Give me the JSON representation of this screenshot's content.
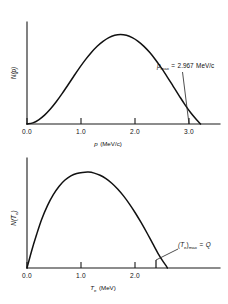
{
  "figure": {
    "background_color": "#ffffff",
    "line_color": "#111111",
    "panels": [
      "momentum-spectrum",
      "kinetic-energy-spectrum"
    ]
  },
  "panel_top": {
    "y_axis_label": "N(p)",
    "x_axis_title_symbol": "p",
    "x_axis_title_unit": "(MeV/c)",
    "x_tick_labels": [
      "0.0",
      "1.0",
      "2.0",
      "3.0"
    ],
    "annotation": {
      "symbol": "p",
      "subscript": "max",
      "equals": "=",
      "value": "2.967",
      "unit": "MeV/c",
      "full_text": "pmax = 2.967 MeV/c"
    }
  },
  "panel_bottom": {
    "y_axis_label": "N(Te)",
    "y_axis_label_symbol": "N(T",
    "y_axis_label_sub": "e",
    "y_axis_label_close": ")",
    "x_axis_title_symbol": "T",
    "x_axis_title_sub": "e",
    "x_axis_title_unit": "(MeV)",
    "x_tick_labels": [
      "0.0",
      "1.0",
      "2.0"
    ],
    "annotation": {
      "open": "(T",
      "subscript_e": "e",
      "close": ")",
      "subscript_max": "max",
      "equals": "=",
      "value": "Q",
      "full_text": "(Te)max = Q"
    }
  },
  "chart_data": [
    {
      "type": "line",
      "id": "momentum-spectrum",
      "title": "",
      "xlabel": "p (MeV/c)",
      "ylabel": "N(p)",
      "xlim": [
        0.0,
        3.3
      ],
      "ylim": [
        0,
        1.05
      ],
      "xticks": [
        0.0,
        1.0,
        2.0,
        3.0
      ],
      "grid": false,
      "legend": null,
      "annotations": [
        {
          "text": "pmax = 2.967 MeV/c",
          "points_to_x": 2.967,
          "points_to_y": 0.0
        }
      ],
      "x": [
        0.0,
        0.1,
        0.2,
        0.3,
        0.4,
        0.5,
        0.6,
        0.7,
        0.8,
        0.9,
        1.0,
        1.1,
        1.2,
        1.3,
        1.4,
        1.5,
        1.6,
        1.7,
        1.8,
        1.9,
        2.0,
        2.1,
        2.2,
        2.3,
        2.4,
        2.5,
        2.6,
        2.7,
        2.8,
        2.9,
        2.967
      ],
      "y": [
        0.0,
        0.012,
        0.045,
        0.095,
        0.16,
        0.238,
        0.325,
        0.418,
        0.512,
        0.604,
        0.69,
        0.767,
        0.833,
        0.886,
        0.926,
        0.95,
        0.958,
        0.95,
        0.926,
        0.886,
        0.832,
        0.765,
        0.686,
        0.598,
        0.503,
        0.404,
        0.305,
        0.208,
        0.12,
        0.045,
        0.0
      ]
    },
    {
      "type": "line",
      "id": "kinetic-energy-spectrum",
      "title": "",
      "xlabel": "Te (MeV)",
      "ylabel": "N(Te)",
      "xlim": [
        0.0,
        3.3
      ],
      "ylim": [
        0,
        1.05
      ],
      "xticks": [
        0.0,
        1.0,
        2.0
      ],
      "grid": false,
      "legend": null,
      "annotations": [
        {
          "text": "(Te)max = Q",
          "points_to_x": 2.4,
          "points_to_y": 0.0
        }
      ],
      "x": [
        0.0,
        0.08,
        0.16,
        0.25,
        0.35,
        0.45,
        0.55,
        0.65,
        0.75,
        0.85,
        0.95,
        1.05,
        1.15,
        1.25,
        1.35,
        1.45,
        1.55,
        1.65,
        1.75,
        1.85,
        1.95,
        2.05,
        2.15,
        2.25,
        2.32,
        2.38,
        2.4
      ],
      "y": [
        0.0,
        0.175,
        0.33,
        0.49,
        0.63,
        0.74,
        0.826,
        0.888,
        0.93,
        0.955,
        0.965,
        0.968,
        0.958,
        0.936,
        0.902,
        0.856,
        0.798,
        0.728,
        0.648,
        0.558,
        0.46,
        0.356,
        0.246,
        0.138,
        0.072,
        0.022,
        0.0
      ]
    }
  ]
}
